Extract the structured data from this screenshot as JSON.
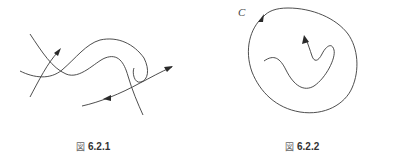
{
  "figures": [
    {
      "caption_symbol": "図",
      "caption_number": "6.2.1",
      "description": "Several tangled directed curves with arrowheads crossing each other"
    },
    {
      "caption_symbol": "図",
      "caption_number": "6.2.2",
      "curve_label": "C",
      "description": "Closed curve C with a counterclockwise arrow enclosing an open wiggly directed curve"
    }
  ],
  "colors": {
    "stroke": "#3a3a3a",
    "background": "#ffffff"
  }
}
